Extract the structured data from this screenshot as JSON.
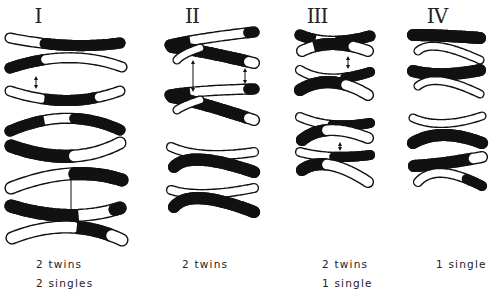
{
  "figure": {
    "colors": {
      "dark": "#111111",
      "light": "#ffffff",
      "outline": "#111111",
      "background": "#ffffff"
    },
    "columns": [
      {
        "id": "I",
        "title": "I",
        "title_x": 32,
        "title_y": 4,
        "captions": [
          "2 twins",
          "2 singles"
        ],
        "caption_x": 36,
        "chromatids": [
          {
            "x1": 10,
            "y1": 38,
            "x2": 120,
            "y2": 43,
            "cx": 70,
            "cy": 50,
            "w": 9,
            "segs": [
              [
                "l",
                0.28
              ],
              [
                "d",
                1
              ]
            ]
          },
          {
            "x1": 10,
            "y1": 68,
            "x2": 122,
            "y2": 67,
            "cx": 70,
            "cy": 48,
            "w": 9,
            "segs": [
              [
                "d",
                0.28
              ],
              [
                "l",
                1
              ]
            ]
          },
          {
            "x1": 10,
            "y1": 91,
            "x2": 120,
            "y2": 91,
            "cx": 68,
            "cy": 110,
            "w": 9,
            "segs": [
              [
                "l",
                0.28
              ],
              [
                "d",
                0.78
              ],
              [
                "l",
                1
              ]
            ]
          },
          {
            "x1": 10,
            "y1": 131,
            "x2": 120,
            "y2": 130,
            "cx": 68,
            "cy": 106,
            "w": 9,
            "segs": [
              [
                "d",
                0.28
              ],
              [
                "l",
                0.57
              ],
              [
                "d",
                1
              ]
            ]
          },
          {
            "x1": 11,
            "y1": 146,
            "x2": 120,
            "y2": 143,
            "cx": 72,
            "cy": 168,
            "w": 11,
            "segs": [
              [
                "d",
                0.55
              ],
              [
                "l",
                1
              ]
            ]
          },
          {
            "x1": 11,
            "y1": 188,
            "x2": 122,
            "y2": 180,
            "cx": 72,
            "cy": 164,
            "w": 11,
            "segs": [
              [
                "l",
                0.55
              ],
              [
                "d",
                1
              ]
            ]
          },
          {
            "x1": 11,
            "y1": 206,
            "x2": 120,
            "y2": 208,
            "cx": 70,
            "cy": 224,
            "w": 11,
            "segs": [
              [
                "d",
                0.58
              ],
              [
                "l",
                0.94
              ],
              [
                "d",
                1
              ]
            ]
          },
          {
            "x1": 12,
            "y1": 238,
            "x2": 122,
            "y2": 240,
            "cx": 70,
            "cy": 215,
            "w": 11,
            "segs": [
              [
                "l",
                0.56
              ],
              [
                "d",
                0.9
              ],
              [
                "l",
                1
              ]
            ]
          }
        ],
        "arrows": [
          {
            "x": 36,
            "y1": 76,
            "y2": 89
          },
          {
            "x": 71,
            "y1": 176,
            "y2": 213
          }
        ]
      },
      {
        "id": "II",
        "title": "II",
        "title_x": 186,
        "title_y": 4,
        "captions": [
          "2 twins"
        ],
        "caption_x": 182,
        "chromatids": [
          {
            "x1": 170,
            "y1": 45,
            "x2": 254,
            "y2": 32,
            "cx": 200,
            "cy": 38,
            "w": 9,
            "segs": [
              [
                "d",
                0.28
              ],
              [
                "l",
                0.93
              ],
              [
                "d",
                1
              ]
            ]
          },
          {
            "x1": 172,
            "y1": 47,
            "x2": 254,
            "y2": 63,
            "cx": 200,
            "cy": 50,
            "w": 10,
            "segs": [
              [
                "d",
                0.93
              ],
              [
                "l",
                1
              ]
            ]
          },
          {
            "x1": 177,
            "y1": 60,
            "x2": 200,
            "y2": 48,
            "cx": 182,
            "cy": 54,
            "w": 7,
            "segs": [
              [
                "l",
                1
              ]
            ]
          },
          {
            "x1": 170,
            "y1": 95,
            "x2": 254,
            "y2": 89,
            "cx": 200,
            "cy": 90,
            "w": 9,
            "segs": [
              [
                "d",
                0.28
              ],
              [
                "l",
                0.93
              ],
              [
                "d",
                1
              ]
            ]
          },
          {
            "x1": 172,
            "y1": 97,
            "x2": 254,
            "y2": 120,
            "cx": 200,
            "cy": 102,
            "w": 10,
            "segs": [
              [
                "d",
                0.93
              ],
              [
                "l",
                1
              ]
            ]
          },
          {
            "x1": 177,
            "y1": 110,
            "x2": 200,
            "y2": 100,
            "cx": 182,
            "cy": 106,
            "w": 7,
            "segs": [
              [
                "l",
                1
              ]
            ]
          },
          {
            "x1": 171,
            "y1": 147,
            "x2": 254,
            "y2": 152,
            "cx": 200,
            "cy": 160,
            "w": 8,
            "segs": [
              [
                "l",
                1
              ]
            ]
          },
          {
            "x1": 174,
            "y1": 167,
            "x2": 254,
            "y2": 172,
            "cx": 190,
            "cy": 150,
            "w": 10,
            "segs": [
              [
                "d",
                1
              ]
            ]
          },
          {
            "x1": 171,
            "y1": 190,
            "x2": 254,
            "y2": 188,
            "cx": 200,
            "cy": 199,
            "w": 8,
            "segs": [
              [
                "l",
                1
              ]
            ]
          },
          {
            "x1": 174,
            "y1": 207,
            "x2": 254,
            "y2": 212,
            "cx": 190,
            "cy": 187,
            "w": 10,
            "segs": [
              [
                "d",
                1
              ]
            ]
          }
        ],
        "arrows": [
          {
            "x": 193,
            "y1": 60,
            "y2": 92
          },
          {
            "x": 245,
            "y1": 68,
            "y2": 84
          }
        ]
      },
      {
        "id": "III",
        "title": "III",
        "title_x": 311,
        "title_y": 4,
        "captions": [
          "2 twins",
          "1 single"
        ],
        "caption_x": 323,
        "chromatids": [
          {
            "x1": 300,
            "y1": 35,
            "x2": 370,
            "y2": 36,
            "cx": 330,
            "cy": 47,
            "w": 9,
            "segs": [
              [
                "d",
                0.25
              ],
              [
                "l",
                0.6
              ],
              [
                "d",
                1
              ]
            ]
          },
          {
            "x1": 302,
            "y1": 51,
            "x2": 368,
            "y2": 51,
            "cx": 330,
            "cy": 37,
            "w": 10,
            "segs": [
              [
                "l",
                0.2
              ],
              [
                "d",
                0.78
              ],
              [
                "l",
                1
              ]
            ]
          },
          {
            "x1": 300,
            "y1": 70,
            "x2": 370,
            "y2": 72,
            "cx": 326,
            "cy": 86,
            "w": 8,
            "segs": [
              [
                "l",
                0.7
              ],
              [
                "d",
                1
              ]
            ]
          },
          {
            "x1": 300,
            "y1": 90,
            "x2": 368,
            "y2": 95,
            "cx": 330,
            "cy": 72,
            "w": 10,
            "segs": [
              [
                "d",
                0.7
              ],
              [
                "l",
                1
              ]
            ]
          },
          {
            "x1": 300,
            "y1": 117,
            "x2": 370,
            "y2": 123,
            "cx": 330,
            "cy": 130,
            "w": 8,
            "segs": [
              [
                "l",
                0.5
              ],
              [
                "d",
                1
              ]
            ]
          },
          {
            "x1": 302,
            "y1": 140,
            "x2": 368,
            "y2": 138,
            "cx": 325,
            "cy": 121,
            "w": 10,
            "segs": [
              [
                "d",
                0.45
              ],
              [
                "l",
                1
              ]
            ]
          },
          {
            "x1": 300,
            "y1": 152,
            "x2": 370,
            "y2": 155,
            "cx": 330,
            "cy": 160,
            "w": 8,
            "segs": [
              [
                "l",
                0.52
              ],
              [
                "d",
                1
              ]
            ]
          },
          {
            "x1": 302,
            "y1": 170,
            "x2": 368,
            "y2": 182,
            "cx": 325,
            "cy": 154,
            "w": 10,
            "segs": [
              [
                "d",
                0.45
              ],
              [
                "l",
                1
              ]
            ]
          }
        ],
        "arrows": [
          {
            "x": 348,
            "y1": 56,
            "y2": 69
          },
          {
            "x": 340,
            "y1": 142,
            "y2": 151
          }
        ]
      },
      {
        "id": "IV",
        "title": "IV",
        "title_x": 431,
        "title_y": 4,
        "captions": [
          "1 single"
        ],
        "caption_x": 436,
        "chromatids": [
          {
            "x1": 413,
            "y1": 35,
            "x2": 480,
            "y2": 38,
            "cx": 440,
            "cy": 35,
            "w": 10,
            "segs": [
              [
                "d",
                1
              ]
            ]
          },
          {
            "x1": 418,
            "y1": 51,
            "x2": 480,
            "y2": 60,
            "cx": 432,
            "cy": 38,
            "w": 7,
            "segs": [
              [
                "l",
                1
              ]
            ]
          },
          {
            "x1": 413,
            "y1": 71,
            "x2": 480,
            "y2": 70,
            "cx": 440,
            "cy": 78,
            "w": 10,
            "segs": [
              [
                "d",
                1
              ]
            ]
          },
          {
            "x1": 418,
            "y1": 86,
            "x2": 480,
            "y2": 94,
            "cx": 435,
            "cy": 72,
            "w": 7,
            "segs": [
              [
                "l",
                1
              ]
            ]
          },
          {
            "x1": 413,
            "y1": 118,
            "x2": 482,
            "y2": 116,
            "cx": 440,
            "cy": 130,
            "w": 7,
            "segs": [
              [
                "l",
                1
              ]
            ]
          },
          {
            "x1": 413,
            "y1": 143,
            "x2": 482,
            "y2": 143,
            "cx": 440,
            "cy": 127,
            "w": 10,
            "segs": [
              [
                "d",
                1
              ]
            ]
          },
          {
            "x1": 414,
            "y1": 166,
            "x2": 482,
            "y2": 157,
            "cx": 438,
            "cy": 165,
            "w": 10,
            "segs": [
              [
                "d",
                0.88
              ],
              [
                "l",
                1
              ]
            ]
          },
          {
            "x1": 418,
            "y1": 182,
            "x2": 482,
            "y2": 186,
            "cx": 436,
            "cy": 162,
            "w": 8,
            "segs": [
              [
                "l",
                0.82
              ],
              [
                "d",
                1
              ]
            ]
          }
        ],
        "arrows": []
      }
    ]
  }
}
